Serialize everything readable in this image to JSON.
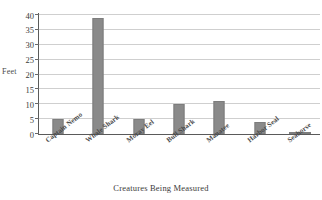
{
  "chart_data": {
    "type": "bar",
    "title": "",
    "xlabel": "Creatures Being Measured",
    "ylabel": "Feet",
    "categories": [
      "Captain Nemo",
      "Whale Shark",
      "Moray Eel",
      "Bull Shark",
      "Manatee",
      "Harbor Seal",
      "Seahorse"
    ],
    "values": [
      5,
      39,
      5,
      10,
      11,
      4,
      0.5
    ],
    "ylim": [
      0,
      40
    ],
    "ytick_labels": [
      "0",
      "5",
      "10",
      "15",
      "20",
      "25",
      "30",
      "35",
      "40"
    ],
    "ytick_values": [
      0,
      5,
      10,
      15,
      20,
      25,
      30,
      35,
      40
    ],
    "grid": true,
    "legend": "none",
    "bar_color": "#8a8a8a",
    "gridline_color": "#cfcfcf",
    "axis_color": "#5a5a5a"
  }
}
